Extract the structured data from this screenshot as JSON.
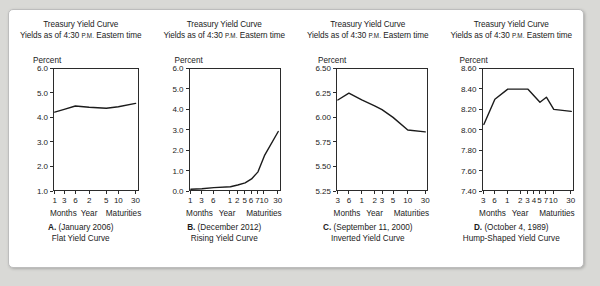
{
  "figure": {
    "background_color": "#d9d9d6",
    "panel_color": "#ffffff",
    "line_color": "#1b1b1b"
  },
  "panels": [
    {
      "header_line1": "Treasury Yield Curve",
      "header_line2_pre": "Yields as of 4:30 ",
      "header_line2_sc": "P.M.",
      "header_line2_post": " Eastern time",
      "ylabel": "Percent",
      "xcat_months": "Months",
      "xcat_year": "Year",
      "xcat_maturities": "Maturities",
      "caption_letter": "A.",
      "caption_date": " (January 2006)",
      "caption_title": "Flat Yield Curve",
      "yticks": [
        "6.0",
        "5.0",
        "4.0",
        "3.0",
        "2.0",
        "1.0"
      ],
      "xticks": [
        "1",
        "3",
        "6",
        "2",
        "5",
        "10",
        "30"
      ]
    },
    {
      "header_line1": "Treasury Yield Curve",
      "header_line2_pre": "Yields as of 4:30 ",
      "header_line2_sc": "P.M.",
      "header_line2_post": " Eastern time",
      "ylabel": "Percent",
      "xcat_months": "Months",
      "xcat_year": "Year",
      "xcat_maturities": "Maturities",
      "caption_letter": "B.",
      "caption_date": " (December 2012)",
      "caption_title": "Rising Yield Curve",
      "yticks": [
        "6.0",
        "5.0",
        "4.0",
        "3.0",
        "2.0",
        "1.0",
        "0.0"
      ],
      "xticks": [
        "1",
        "3",
        "6",
        "1",
        "2",
        "5",
        "6",
        "7",
        "10",
        "30"
      ]
    },
    {
      "header_line1": "Treasury Yield Curve",
      "header_line2_pre": "Yields as of 4:30 ",
      "header_line2_sc": "P.M.",
      "header_line2_post": " Eastern time",
      "ylabel": "Percent",
      "xcat_months": "Months",
      "xcat_year": "Year",
      "xcat_maturities": "Maturities",
      "caption_letter": "C.",
      "caption_date": " (September 11, 2000)",
      "caption_title": "Inverted Yield Curve",
      "yticks": [
        "6.50",
        "6.25",
        "6.00",
        "5.75",
        "5.50",
        "5.25"
      ],
      "xticks": [
        "3",
        "6",
        "1",
        "2",
        "3",
        "5",
        "10",
        "30"
      ]
    },
    {
      "header_line1": "Treasury Yield Curve",
      "header_line2_pre": "Yields as of 4:30 ",
      "header_line2_sc": "P.M.",
      "header_line2_post": " Eastern time",
      "ylabel": "Percent",
      "xcat_months": "Months",
      "xcat_year": "Year",
      "xcat_maturities": "Maturities",
      "caption_letter": "D.",
      "caption_date": " (October 4, 1989)",
      "caption_title": "Hump-Shaped Yield Curve",
      "yticks": [
        "8.60",
        "8.40",
        "8.20",
        "8.00",
        "7.80",
        "7.60",
        "7.40"
      ],
      "xticks": [
        "3",
        "6",
        "1",
        "2",
        "3",
        "4",
        "5",
        "7",
        "10",
        "30"
      ]
    }
  ],
  "chart_data": [
    {
      "type": "line",
      "title": "Treasury Yield Curve",
      "subtitle": "Yields as of 4:30 P.M. Eastern time",
      "caption": "A. (January 2006) Flat Yield Curve",
      "xlabel": "Maturities",
      "ylabel": "Percent",
      "ylim": [
        1.0,
        6.0
      ],
      "yticks": [
        6.0,
        5.0,
        4.0,
        3.0,
        2.0,
        1.0
      ],
      "categories": [
        "1 mo",
        "3 mo",
        "6 mo",
        "2 yr",
        "5 yr",
        "10 yr",
        "30 yr"
      ],
      "tick_labels": [
        "1",
        "3",
        "6",
        "2",
        "5",
        "10",
        "30"
      ],
      "values": [
        4.22,
        4.33,
        4.47,
        4.42,
        4.38,
        4.44,
        4.58
      ],
      "grid": false,
      "legend": "none"
    },
    {
      "type": "line",
      "title": "Treasury Yield Curve",
      "subtitle": "Yields as of 4:30 P.M. Eastern time",
      "caption": "B. (December 2012) Rising Yield Curve",
      "xlabel": "Maturities",
      "ylabel": "Percent",
      "ylim": [
        0.0,
        6.0
      ],
      "yticks": [
        6.0,
        5.0,
        4.0,
        3.0,
        2.0,
        1.0,
        0.0
      ],
      "categories": [
        "1 mo",
        "3 mo",
        "6 mo",
        "1 yr",
        "2 yr",
        "5 yr",
        "6 yr",
        "7 yr",
        "10 yr",
        "30 yr"
      ],
      "tick_labels": [
        "1",
        "3",
        "6",
        "1",
        "2",
        "5",
        "6",
        "7",
        "10",
        "30"
      ],
      "values": [
        0.04,
        0.06,
        0.12,
        0.16,
        0.25,
        0.35,
        0.55,
        0.9,
        1.7,
        2.9
      ],
      "grid": false,
      "legend": "none"
    },
    {
      "type": "line",
      "title": "Treasury Yield Curve",
      "subtitle": "Yields as of 4:30 P.M. Eastern time",
      "caption": "C. (September 11, 2000) Inverted Yield Curve",
      "xlabel": "Maturities",
      "ylabel": "Percent",
      "ylim": [
        5.25,
        6.5
      ],
      "yticks": [
        6.5,
        6.25,
        6.0,
        5.75,
        5.5,
        5.25
      ],
      "categories": [
        "3 mo",
        "6 mo",
        "1 yr",
        "2 yr",
        "3 yr",
        "5 yr",
        "10 yr",
        "30 yr"
      ],
      "tick_labels": [
        "3",
        "6",
        "1",
        "2",
        "3",
        "5",
        "10",
        "30"
      ],
      "values": [
        6.18,
        6.25,
        6.18,
        6.12,
        6.08,
        6.0,
        5.87,
        5.85
      ],
      "grid": false,
      "legend": "none"
    },
    {
      "type": "line",
      "title": "Treasury Yield Curve",
      "subtitle": "Yields as of 4:30 P.M. Eastern time",
      "caption": "D. (October 4, 1989) Hump-Shaped Yield Curve",
      "xlabel": "Maturities",
      "ylabel": "Percent",
      "ylim": [
        7.4,
        8.6
      ],
      "yticks": [
        8.6,
        8.4,
        8.2,
        8.0,
        7.8,
        7.6,
        7.4
      ],
      "categories": [
        "3 mo",
        "6 mo",
        "1 yr",
        "2 yr",
        "3 yr",
        "4 yr",
        "5 yr",
        "7 yr",
        "10 yr",
        "30 yr"
      ],
      "tick_labels": [
        "3",
        "6",
        "1",
        "2",
        "3",
        "4",
        "5",
        "7",
        "10",
        "30"
      ],
      "values": [
        8.05,
        8.3,
        8.4,
        8.4,
        8.4,
        8.33,
        8.27,
        8.32,
        8.2,
        8.18
      ],
      "grid": false,
      "legend": "none"
    }
  ]
}
